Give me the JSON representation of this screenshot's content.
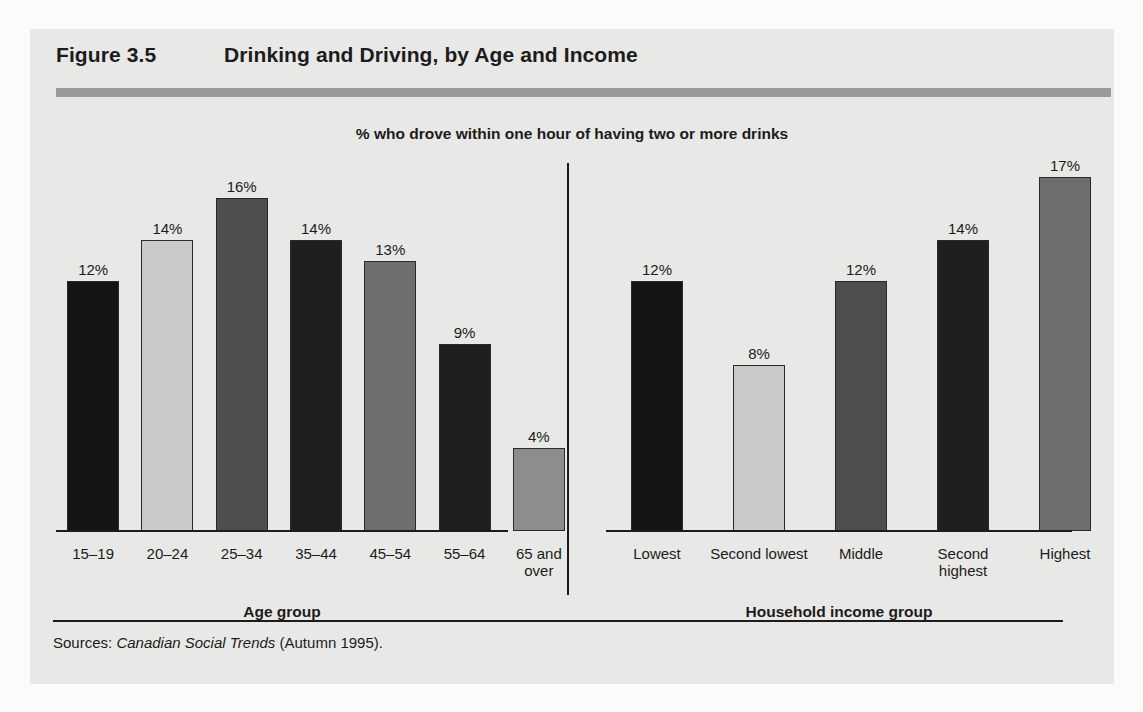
{
  "figure": {
    "number": "Figure 3.5",
    "title": "Drinking and Driving, by Age and Income",
    "subtitle": "% who drove within one hour of having two or more drinks",
    "source_prefix": "Sources:",
    "source_italic": "Canadian Social Trends",
    "source_suffix": "(Autumn 1995)."
  },
  "colors": {
    "panel_background": "#e8e8e6",
    "page_background": "#fbfbfa",
    "title_rule": "#9a9a9a",
    "axis": "#1c1c1c",
    "text": "#1c1c1c",
    "bar_very_dark": "#141414",
    "bar_dark": "#1f1f1f",
    "bar_medium_dark": "#4e4e4e",
    "bar_medium": "#6e6e6e",
    "bar_medium_light": "#8d8d8d",
    "bar_light": "#c9c9c9"
  },
  "chart_data": [
    {
      "type": "bar",
      "title": "Drinking and Driving, by Age",
      "subtitle": "% who drove within one hour of having two or more drinks",
      "xlabel": "Age group",
      "ylabel": "",
      "ylim": [
        0,
        18
      ],
      "grid": false,
      "legend": "none",
      "categories": [
        "15–19",
        "20–24",
        "25–34",
        "35–44",
        "45–54",
        "55–64",
        "65 and\nover"
      ],
      "values": [
        12,
        14,
        16,
        14,
        13,
        9,
        4
      ],
      "value_labels": [
        "12%",
        "14%",
        "16%",
        "14%",
        "13%",
        "9%",
        "4%"
      ],
      "bar_colors": [
        "#141414",
        "#c9c9c9",
        "#4e4e4e",
        "#1f1f1f",
        "#6e6e6e",
        "#1f1f1f",
        "#8d8d8d"
      ]
    },
    {
      "type": "bar",
      "title": "Drinking and Driving, by Income",
      "subtitle": "% who drove within one hour of having two or more drinks",
      "xlabel": "Household income group",
      "ylabel": "",
      "ylim": [
        0,
        18
      ],
      "grid": false,
      "legend": "none",
      "categories": [
        "Lowest",
        "Second lowest",
        "Middle",
        "Second highest",
        "Highest"
      ],
      "values": [
        12,
        8,
        12,
        14,
        17
      ],
      "value_labels": [
        "12%",
        "8%",
        "12%",
        "14%",
        "17%"
      ],
      "bar_colors": [
        "#141414",
        "#c9c9c9",
        "#4e4e4e",
        "#1f1f1f",
        "#6e6e6e"
      ]
    }
  ]
}
